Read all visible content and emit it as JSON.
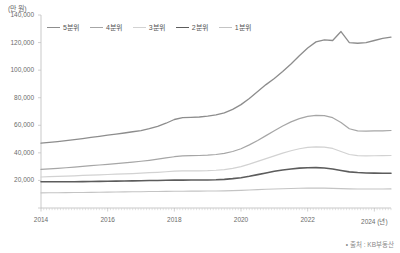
{
  "chart_data": {
    "type": "line",
    "title": "",
    "unit_label": "(만 원)",
    "xlabel": "(년)",
    "ylabel": "",
    "ylim": [
      0,
      140000
    ],
    "yticks": [
      0,
      20000,
      40000,
      60000,
      80000,
      100000,
      120000,
      140000
    ],
    "ytick_labels": [
      "",
      "20,000",
      "40,000",
      "60,000",
      "80,000",
      "100,000",
      "120,000",
      "140,000"
    ],
    "xlim": [
      2014,
      2024.5
    ],
    "xticks": [
      2014,
      2016,
      2018,
      2020,
      2022,
      2024
    ],
    "xtick_labels": [
      "2014",
      "2016",
      "2018",
      "2020",
      "2022",
      "2024 (년)"
    ],
    "grid": false,
    "legend_position": "top-left",
    "x": [
      2014.0,
      2014.25,
      2014.5,
      2014.75,
      2015.0,
      2015.25,
      2015.5,
      2015.75,
      2016.0,
      2016.25,
      2016.5,
      2016.75,
      2017.0,
      2017.25,
      2017.5,
      2017.75,
      2018.0,
      2018.25,
      2018.5,
      2018.75,
      2019.0,
      2019.25,
      2019.5,
      2019.75,
      2020.0,
      2020.25,
      2020.5,
      2020.75,
      2021.0,
      2021.25,
      2021.5,
      2021.75,
      2022.0,
      2022.25,
      2022.5,
      2022.75,
      2023.0,
      2023.25,
      2023.5,
      2023.75,
      2024.0,
      2024.25,
      2024.5
    ],
    "series": [
      {
        "name": "5분위",
        "color": "#8d8d8d",
        "width": 1.3,
        "values": [
          47000,
          47600,
          48200,
          48900,
          49600,
          50400,
          51200,
          52000,
          52800,
          53600,
          54400,
          55300,
          56200,
          57500,
          59200,
          61500,
          64200,
          65500,
          65800,
          66000,
          66600,
          67500,
          69000,
          71500,
          75000,
          79500,
          84500,
          89500,
          94000,
          99000,
          104500,
          110500,
          116000,
          120500,
          122000,
          121500,
          128000,
          120000,
          119500,
          120000,
          121500,
          123000,
          124000
        ]
      },
      {
        "name": "4분위",
        "color": "#a6a6a6",
        "width": 1.2,
        "values": [
          28000,
          28400,
          28800,
          29200,
          29700,
          30200,
          30700,
          31200,
          31700,
          32200,
          32700,
          33300,
          33900,
          34600,
          35400,
          36300,
          37200,
          37800,
          38000,
          38100,
          38300,
          38800,
          39600,
          41000,
          43000,
          45800,
          49000,
          52500,
          56000,
          59500,
          62500,
          64800,
          66500,
          67200,
          67000,
          65500,
          62000,
          57500,
          56000,
          55800,
          55900,
          56000,
          56200
        ]
      },
      {
        "name": "3분위",
        "color": "#d2d2d2",
        "width": 1.2,
        "values": [
          22500,
          22700,
          22900,
          23100,
          23300,
          23600,
          23900,
          24100,
          24300,
          24500,
          24700,
          25000,
          25300,
          25600,
          25900,
          26300,
          26700,
          26900,
          27000,
          27000,
          27100,
          27400,
          27900,
          28800,
          30000,
          31800,
          33800,
          35800,
          37800,
          39800,
          41500,
          43000,
          44000,
          44400,
          44200,
          43200,
          41000,
          38800,
          38000,
          37800,
          37900,
          38000,
          38100
        ]
      },
      {
        "name": "2분위",
        "color": "#5c5c5c",
        "width": 1.6,
        "values": [
          19000,
          19000,
          19000,
          19000,
          19000,
          19100,
          19200,
          19300,
          19400,
          19500,
          19600,
          19700,
          19800,
          19900,
          20000,
          20100,
          20200,
          20250,
          20300,
          20300,
          20350,
          20500,
          20800,
          21300,
          22000,
          23000,
          24200,
          25400,
          26600,
          27600,
          28300,
          28900,
          29200,
          29300,
          29000,
          28300,
          27200,
          26200,
          25700,
          25400,
          25300,
          25250,
          25200
        ]
      },
      {
        "name": "1분위",
        "color": "#c4c4c4",
        "width": 1.1,
        "values": [
          11000,
          11050,
          11100,
          11150,
          11200,
          11280,
          11360,
          11440,
          11520,
          11600,
          11680,
          11760,
          11840,
          11920,
          12000,
          12080,
          12160,
          12200,
          12240,
          12250,
          12280,
          12350,
          12450,
          12600,
          12800,
          13050,
          13300,
          13550,
          13800,
          14000,
          14150,
          14300,
          14400,
          14450,
          14400,
          14250,
          14050,
          13900,
          13800,
          13780,
          13800,
          13820,
          13850
        ]
      }
    ],
    "source_note": "• 출처 : KB부동산"
  }
}
